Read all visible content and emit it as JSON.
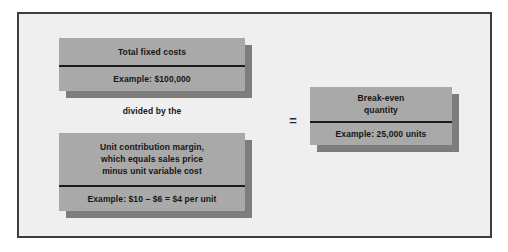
{
  "figure": {
    "colors": {
      "frame_border": "#3d3d3d",
      "panel_background": "#efefef",
      "box_fill": "#a9a9a9",
      "box_shadow": "#7d7d7d",
      "rule": "#1c1c1c",
      "text": "#151515"
    }
  },
  "boxes": {
    "fixed_costs": {
      "heading": "Total fixed costs",
      "example": "Example: $100,000"
    },
    "unit_contribution_margin": {
      "heading": "Unit contribution margin,\nwhich equals sales price\nminus unit variable cost",
      "example": "Example: $10 – $6 = $4 per unit"
    },
    "breakeven": {
      "heading": "Break-even\nquantity",
      "example": "Example: 25,000 units"
    }
  },
  "connectors": {
    "divided_by": "divided by the",
    "equals": "="
  }
}
